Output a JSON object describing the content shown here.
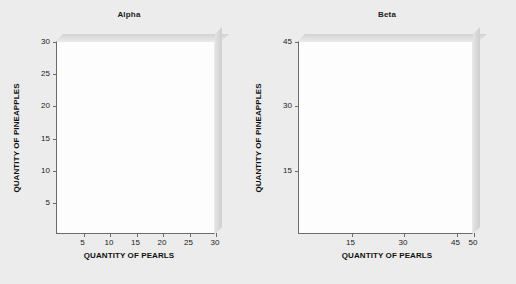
{
  "figure": {
    "background_color": "#ececec",
    "panel_face_color": "#fdfdfd",
    "axis_color": "#6b6b6b",
    "text_color": "#1b1b1b"
  },
  "chart_data": [
    {
      "type": "scatter",
      "title": "Alpha",
      "xlabel": "QUANTITY OF PEARLS",
      "ylabel": "QUANTITY OF PINEAPPLES",
      "xlim": [
        0,
        30
      ],
      "ylim": [
        0,
        30
      ],
      "xticks": [
        5,
        10,
        15,
        20,
        25,
        30
      ],
      "xticklabels": [
        "5",
        "10",
        "15",
        "20",
        "25",
        "30"
      ],
      "yticks": [
        5,
        10,
        15,
        20,
        25,
        30
      ],
      "yticklabels": [
        "5",
        "10",
        "15",
        "20",
        "25",
        "30"
      ],
      "grid": false,
      "legend": false,
      "series": [],
      "x": [],
      "values": [],
      "annotations": []
    },
    {
      "type": "scatter",
      "title": "Beta",
      "xlabel": "QUANTITY OF PEARLS",
      "ylabel": "QUANTITY OF PINEAPPLES",
      "xlim": [
        0,
        50
      ],
      "ylim": [
        0,
        45
      ],
      "xticks": [
        15,
        30,
        45,
        50
      ],
      "xticklabels": [
        "15",
        "30",
        "45",
        "50"
      ],
      "yticks": [
        15,
        30,
        45
      ],
      "yticklabels": [
        "15",
        "30",
        "45"
      ],
      "grid": false,
      "legend": false,
      "series": [],
      "x": [],
      "values": [],
      "annotations": []
    }
  ]
}
